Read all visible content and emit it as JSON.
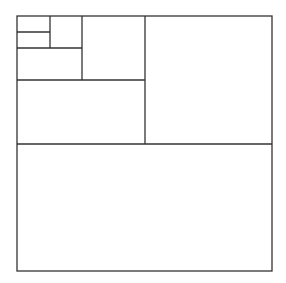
{
  "diagram": {
    "type": "recursive-square-subdivision",
    "stroke_color": "#333333",
    "background": "#ffffff",
    "stroke_width": 1.3,
    "outer": {
      "x": 17,
      "y": 16,
      "width": 255,
      "height": 255
    },
    "lines": [
      {
        "name": "divider-half-horizontal",
        "x1": 17,
        "y1": 144,
        "x2": 272,
        "y2": 144
      },
      {
        "name": "divider-quarter-vertical",
        "x1": 145,
        "y1": 16,
        "x2": 145,
        "y2": 144
      },
      {
        "name": "divider-eighth-horizontal",
        "x1": 17,
        "y1": 80,
        "x2": 145,
        "y2": 80
      },
      {
        "name": "divider-sixteenth-vertical",
        "x1": 82,
        "y1": 16,
        "x2": 82,
        "y2": 80
      },
      {
        "name": "divider-thirtysecond-horizontal",
        "x1": 17,
        "y1": 48,
        "x2": 82,
        "y2": 48
      },
      {
        "name": "divider-sixtyfourth-vertical",
        "x1": 50,
        "y1": 16,
        "x2": 50,
        "y2": 48
      },
      {
        "name": "divider-onetwentyeighth-horizontal",
        "x1": 17,
        "y1": 32,
        "x2": 50,
        "y2": 32
      }
    ]
  }
}
